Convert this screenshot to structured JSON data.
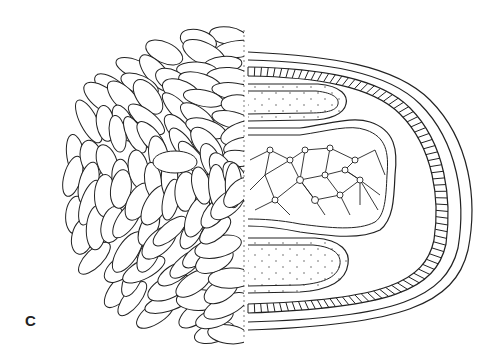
{
  "figure": {
    "panel_label": "C",
    "colors": {
      "stroke": "#222222",
      "background": "#ffffff"
    }
  }
}
